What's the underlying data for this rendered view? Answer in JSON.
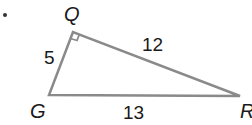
{
  "figure": {
    "type": "right-triangle",
    "vertices": {
      "Q": {
        "label": "Q"
      },
      "G": {
        "label": "G"
      },
      "R": {
        "label": "R"
      }
    },
    "sides": {
      "QG": {
        "label": "5"
      },
      "QR": {
        "label": "12"
      },
      "GR": {
        "label": "13"
      }
    },
    "right_angle_at": "Q",
    "colors": {
      "line": "#8a8a8a",
      "text": "#1a1a1a"
    }
  }
}
